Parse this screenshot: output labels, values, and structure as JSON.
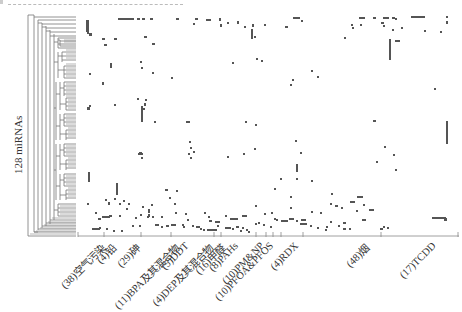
{
  "chart_data": {
    "type": "heatmap",
    "title": "",
    "ylabel": "128 miRNAs",
    "xlabel": "",
    "rows": 128,
    "dendrogram": "hierarchical clustering tree on left (rows)",
    "grid": false,
    "legend": null,
    "categories": [
      {
        "label": "(38)空气污染",
        "count": 38
      },
      {
        "label": "(4)铅",
        "count": 4
      },
      {
        "label": "(29)砷",
        "count": 29
      },
      {
        "label": "(11)BPA及其混合物",
        "count": 11
      },
      {
        "label": "(5)DDT",
        "count": 5
      },
      {
        "label": "(4)DEP及其混合物",
        "count": 4
      },
      {
        "label": "(16)甲醛",
        "count": 16
      },
      {
        "label": "(8)PAHs",
        "count": 8
      },
      {
        "label": "(10)PM&NP",
        "count": 10
      },
      {
        "label": "(10)PFOA&PFOS",
        "count": 10
      },
      {
        "label": "(4)RDX",
        "count": 4
      },
      {
        "label": "(48)烟",
        "count": 48
      },
      {
        "label": "(17)TCDD",
        "count": 17
      }
    ],
    "tick_x_positions": [
      78,
      104,
      141,
      171,
      214,
      221,
      256,
      266,
      273,
      281,
      303,
      381,
      458
    ],
    "label_x_positions": [
      98,
      108,
      133,
      172,
      183,
      206,
      218,
      232,
      258,
      268,
      292,
      362,
      430
    ],
    "cell_color": "#555555",
    "background": "#ffffff"
  },
  "marks": [
    [
      86,
      20,
      3,
      12
    ],
    [
      87,
      30,
      2,
      4
    ],
    [
      89,
      33,
      3,
      3
    ],
    [
      118,
      18,
      6,
      2
    ],
    [
      124,
      18,
      10,
      2
    ],
    [
      137,
      18,
      3,
      2
    ],
    [
      142,
      18,
      3,
      2
    ],
    [
      150,
      18,
      3,
      2
    ],
    [
      176,
      18,
      3,
      2
    ],
    [
      195,
      18,
      3,
      2
    ],
    [
      193,
      23,
      2,
      2
    ],
    [
      206,
      19,
      5,
      2
    ],
    [
      219,
      18,
      2,
      3
    ],
    [
      220,
      24,
      2,
      3
    ],
    [
      227,
      22,
      2,
      2
    ],
    [
      237,
      21,
      2,
      3
    ],
    [
      244,
      26,
      2,
      2
    ],
    [
      252,
      24,
      2,
      3
    ],
    [
      251,
      29,
      2,
      10
    ],
    [
      254,
      36,
      2,
      2
    ],
    [
      264,
      24,
      2,
      2
    ],
    [
      285,
      26,
      3,
      2
    ],
    [
      293,
      17,
      7,
      2
    ],
    [
      301,
      20,
      2,
      2
    ],
    [
      359,
      17,
      6,
      2
    ],
    [
      373,
      17,
      3,
      2
    ],
    [
      383,
      17,
      6,
      2
    ],
    [
      392,
      17,
      3,
      2
    ],
    [
      395,
      18,
      2,
      2
    ],
    [
      411,
      16,
      14,
      2
    ],
    [
      446,
      16,
      2,
      2
    ],
    [
      446,
      21,
      2,
      3
    ],
    [
      360,
      24,
      2,
      2
    ],
    [
      351,
      24,
      2,
      2
    ],
    [
      381,
      22,
      3,
      2
    ],
    [
      383,
      25,
      2,
      2
    ],
    [
      392,
      29,
      2,
      2
    ],
    [
      401,
      27,
      2,
      2
    ],
    [
      352,
      27,
      2,
      2
    ],
    [
      344,
      37,
      2,
      2
    ],
    [
      389,
      39,
      2,
      21
    ],
    [
      395,
      40,
      5,
      2
    ],
    [
      102,
      38,
      3,
      2
    ],
    [
      114,
      38,
      3,
      2
    ],
    [
      144,
      36,
      3,
      2
    ],
    [
      152,
      43,
      3,
      2
    ],
    [
      104,
      44,
      3,
      2
    ],
    [
      232,
      62,
      2,
      2
    ],
    [
      256,
      58,
      2,
      2
    ],
    [
      261,
      60,
      2,
      2
    ],
    [
      292,
      79,
      2,
      2
    ],
    [
      290,
      84,
      2,
      2
    ],
    [
      311,
      70,
      2,
      2
    ],
    [
      317,
      76,
      2,
      2
    ],
    [
      424,
      30,
      2,
      2
    ],
    [
      440,
      31,
      2,
      2
    ],
    [
      140,
      61,
      2,
      2
    ],
    [
      141,
      67,
      2,
      2
    ],
    [
      110,
      63,
      2,
      5
    ],
    [
      152,
      72,
      2,
      2
    ],
    [
      89,
      73,
      2,
      2
    ],
    [
      171,
      77,
      2,
      2
    ],
    [
      434,
      88,
      2,
      2
    ],
    [
      102,
      82,
      2,
      3
    ],
    [
      137,
      98,
      2,
      2
    ],
    [
      145,
      99,
      2,
      2
    ],
    [
      87,
      107,
      3,
      3
    ],
    [
      89,
      105,
      2,
      2
    ],
    [
      114,
      104,
      2,
      2
    ],
    [
      143,
      108,
      2,
      2
    ],
    [
      144,
      103,
      2,
      3
    ],
    [
      141,
      106,
      2,
      16
    ],
    [
      373,
      120,
      3,
      2
    ],
    [
      141,
      110,
      2,
      7
    ],
    [
      154,
      121,
      2,
      2
    ],
    [
      186,
      121,
      4,
      2
    ],
    [
      245,
      121,
      2,
      2
    ],
    [
      255,
      124,
      2,
      2
    ],
    [
      446,
      121,
      2,
      23
    ],
    [
      295,
      140,
      2,
      2
    ],
    [
      300,
      152,
      2,
      2
    ],
    [
      384,
      146,
      2,
      2
    ],
    [
      376,
      161,
      2,
      2
    ],
    [
      393,
      154,
      2,
      2
    ],
    [
      395,
      169,
      2,
      2
    ],
    [
      139,
      152,
      2,
      2
    ],
    [
      141,
      153,
      2,
      2
    ],
    [
      190,
      147,
      2,
      2
    ],
    [
      193,
      151,
      2,
      2
    ],
    [
      140,
      152,
      2,
      2
    ],
    [
      188,
      153,
      2,
      2
    ],
    [
      189,
      141,
      2,
      2
    ],
    [
      138,
      153,
      2,
      2
    ],
    [
      190,
      157,
      2,
      2
    ],
    [
      141,
      157,
      2,
      2
    ],
    [
      139,
      153,
      2,
      2
    ],
    [
      114,
      198,
      2,
      2
    ],
    [
      116,
      188,
      2,
      2
    ],
    [
      88,
      172,
      2,
      10
    ],
    [
      116,
      183,
      2,
      12
    ],
    [
      105,
      199,
      2,
      2
    ],
    [
      108,
      202,
      2,
      3
    ],
    [
      119,
      203,
      2,
      2
    ],
    [
      128,
      203,
      2,
      2
    ],
    [
      126,
      208,
      2,
      2
    ],
    [
      123,
      200,
      2,
      2
    ],
    [
      296,
      164,
      2,
      8
    ],
    [
      296,
      178,
      2,
      2
    ],
    [
      254,
      148,
      2,
      2
    ],
    [
      243,
      153,
      2,
      2
    ],
    [
      227,
      156,
      2,
      2
    ],
    [
      280,
      178,
      2,
      2
    ],
    [
      311,
      180,
      2,
      2
    ],
    [
      290,
      196,
      2,
      2
    ],
    [
      274,
      188,
      2,
      2
    ],
    [
      290,
      207,
      2,
      2
    ],
    [
      271,
      212,
      2,
      2
    ],
    [
      255,
      205,
      2,
      2
    ],
    [
      264,
      213,
      2,
      2
    ],
    [
      230,
      218,
      8,
      2
    ],
    [
      242,
      215,
      5,
      2
    ],
    [
      274,
      218,
      2,
      2
    ],
    [
      300,
      223,
      7,
      2
    ],
    [
      317,
      227,
      2,
      2
    ],
    [
      331,
      193,
      2,
      2
    ],
    [
      335,
      205,
      3,
      2
    ],
    [
      341,
      207,
      2,
      2
    ],
    [
      350,
      201,
      5,
      2
    ],
    [
      363,
      204,
      2,
      2
    ],
    [
      357,
      196,
      6,
      2
    ],
    [
      311,
      211,
      2,
      2
    ],
    [
      320,
      212,
      2,
      2
    ],
    [
      330,
      203,
      2,
      2
    ],
    [
      362,
      219,
      4,
      2
    ],
    [
      343,
      222,
      3,
      2
    ],
    [
      356,
      210,
      2,
      2
    ],
    [
      369,
      209,
      5,
      2
    ],
    [
      432,
      217,
      14,
      2
    ],
    [
      444,
      218,
      3,
      3
    ],
    [
      330,
      221,
      2,
      2
    ],
    [
      87,
      203,
      2,
      2
    ],
    [
      95,
      212,
      2,
      2
    ],
    [
      98,
      218,
      3,
      2
    ],
    [
      102,
      216,
      8,
      2
    ],
    [
      109,
      215,
      3,
      2
    ],
    [
      119,
      215,
      2,
      2
    ],
    [
      135,
      217,
      2,
      2
    ],
    [
      152,
      216,
      2,
      2
    ],
    [
      183,
      226,
      2,
      2
    ],
    [
      165,
      189,
      3,
      2
    ],
    [
      169,
      197,
      2,
      2
    ],
    [
      176,
      190,
      2,
      2
    ],
    [
      174,
      203,
      2,
      2
    ],
    [
      185,
      213,
      2,
      2
    ],
    [
      142,
      206,
      2,
      2
    ],
    [
      151,
      204,
      2,
      2
    ],
    [
      140,
      214,
      2,
      2
    ],
    [
      147,
      216,
      2,
      2
    ],
    [
      161,
      216,
      2,
      2
    ],
    [
      175,
      212,
      2,
      2
    ],
    [
      187,
      219,
      2,
      2
    ],
    [
      204,
      212,
      2,
      2
    ],
    [
      208,
      216,
      2,
      2
    ],
    [
      209,
      220,
      3,
      2
    ],
    [
      215,
      221,
      5,
      2
    ],
    [
      225,
      215,
      2,
      2
    ],
    [
      132,
      225,
      2,
      2
    ],
    [
      139,
      225,
      2,
      2
    ],
    [
      148,
      209,
      2,
      4
    ],
    [
      148,
      214,
      2,
      3
    ],
    [
      155,
      224,
      4,
      2
    ],
    [
      161,
      226,
      2,
      2
    ],
    [
      166,
      225,
      3,
      2
    ],
    [
      171,
      224,
      5,
      2
    ],
    [
      182,
      224,
      2,
      2
    ],
    [
      192,
      225,
      2,
      2
    ],
    [
      196,
      226,
      4,
      2
    ],
    [
      200,
      228,
      2,
      2
    ],
    [
      203,
      229,
      2,
      2
    ],
    [
      207,
      229,
      4,
      2
    ],
    [
      211,
      229,
      6,
      2
    ],
    [
      217,
      225,
      2,
      2
    ],
    [
      225,
      227,
      6,
      2
    ],
    [
      232,
      228,
      2,
      2
    ],
    [
      236,
      226,
      3,
      2
    ],
    [
      255,
      223,
      2,
      2
    ],
    [
      258,
      222,
      2,
      2
    ],
    [
      263,
      224,
      2,
      2
    ],
    [
      270,
      226,
      2,
      2
    ],
    [
      276,
      219,
      2,
      2
    ],
    [
      281,
      220,
      7,
      2
    ],
    [
      289,
      218,
      5,
      2
    ],
    [
      296,
      220,
      2,
      2
    ],
    [
      301,
      219,
      5,
      2
    ],
    [
      310,
      225,
      2,
      2
    ],
    [
      325,
      229,
      2,
      2
    ],
    [
      326,
      226,
      2,
      2
    ],
    [
      338,
      225,
      2,
      2
    ],
    [
      343,
      228,
      3,
      2
    ],
    [
      349,
      228,
      2,
      2
    ],
    [
      380,
      228,
      3,
      2
    ],
    [
      383,
      226,
      2,
      2
    ],
    [
      387,
      227,
      2,
      2
    ],
    [
      240,
      230,
      2,
      2
    ],
    [
      242,
      227,
      2,
      2
    ],
    [
      246,
      229,
      2,
      2
    ],
    [
      248,
      231,
      2,
      2
    ],
    [
      92,
      228,
      8,
      2
    ],
    [
      99,
      227,
      2,
      2
    ],
    [
      106,
      228,
      2,
      2
    ],
    [
      113,
      230,
      2,
      2
    ],
    [
      121,
      230,
      2,
      2
    ]
  ]
}
